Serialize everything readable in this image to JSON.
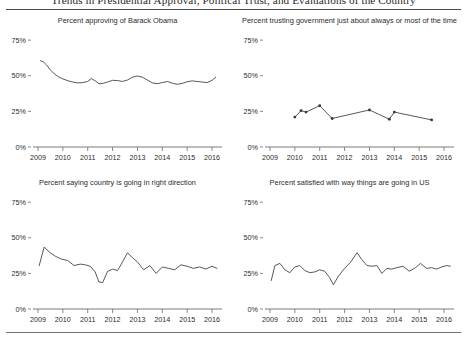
{
  "figure": {
    "title": "Trends in Presidential Approval, Political Trust, and Evaluations of the Country",
    "background": "#ffffff",
    "line_color": "#3a3a3a",
    "axis_color": "#6b6b6b",
    "text_color": "#2b2b2b"
  },
  "axis": {
    "y_ticks": [
      "0%",
      "25%",
      "50%",
      "75%"
    ],
    "y_values": [
      0,
      25,
      50,
      75
    ],
    "ylim": [
      0,
      80
    ],
    "x_ticks": [
      "2009",
      "2010",
      "2011",
      "2012",
      "2013",
      "2014",
      "2015",
      "2016"
    ],
    "x_values": [
      2009,
      2010,
      2011,
      2012,
      2013,
      2014,
      2015,
      2016
    ],
    "xlim": [
      2008.8,
      2016.4
    ],
    "grid": false,
    "legend": "none"
  },
  "chart_data": [
    {
      "type": "line",
      "panel": 0,
      "title": "Percent approving of Barack Obama",
      "xlabel": "",
      "ylabel": "",
      "ylim": [
        0,
        80
      ],
      "xlim": [
        2008.8,
        2016.4
      ],
      "markers": false,
      "x": [
        2009.1,
        2009.2,
        2009.35,
        2009.5,
        2009.65,
        2009.8,
        2010.0,
        2010.2,
        2010.4,
        2010.6,
        2010.8,
        2011.0,
        2011.15,
        2011.3,
        2011.45,
        2011.6,
        2011.8,
        2012.0,
        2012.2,
        2012.4,
        2012.6,
        2012.8,
        2013.0,
        2013.2,
        2013.4,
        2013.6,
        2013.8,
        2014.0,
        2014.2,
        2014.4,
        2014.6,
        2014.8,
        2015.0,
        2015.2,
        2015.4,
        2015.6,
        2015.8,
        2016.0,
        2016.15
      ],
      "y": [
        60.5,
        60.0,
        57.5,
        54.0,
        51.5,
        49.5,
        47.8,
        46.5,
        45.6,
        45.0,
        45.2,
        46.0,
        48.0,
        46.5,
        44.4,
        44.6,
        45.6,
        46.8,
        46.6,
        46.0,
        47.0,
        49.0,
        49.8,
        49.0,
        47.0,
        45.0,
        44.4,
        45.2,
        46.0,
        44.8,
        44.0,
        44.6,
        45.8,
        46.4,
        46.0,
        45.6,
        45.2,
        46.8,
        49.0
      ]
    },
    {
      "type": "line",
      "panel": 1,
      "title": "Percent trusting government just about always or most of the time",
      "xlabel": "",
      "ylabel": "",
      "ylim": [
        0,
        80
      ],
      "xlim": [
        2008.8,
        2016.4
      ],
      "markers": true,
      "x": [
        2010.0,
        2010.25,
        2010.45,
        2011.0,
        2011.5,
        2013.0,
        2013.8,
        2014.0,
        2015.5
      ],
      "y": [
        21.0,
        25.5,
        24.5,
        29.0,
        20.0,
        26.0,
        19.5,
        24.5,
        19.0
      ]
    },
    {
      "type": "line",
      "panel": 2,
      "title": "Percent saying country is going in right direction",
      "xlabel": "",
      "ylabel": "",
      "ylim": [
        0,
        80
      ],
      "xlim": [
        2008.8,
        2016.4
      ],
      "markers": false,
      "x": [
        2009.05,
        2009.25,
        2009.45,
        2009.7,
        2009.95,
        2010.2,
        2010.45,
        2010.7,
        2010.9,
        2011.1,
        2011.3,
        2011.45,
        2011.6,
        2011.8,
        2012.0,
        2012.2,
        2012.4,
        2012.6,
        2012.8,
        2013.0,
        2013.25,
        2013.5,
        2013.75,
        2014.0,
        2014.25,
        2014.5,
        2014.75,
        2015.0,
        2015.25,
        2015.5,
        2015.75,
        2016.0,
        2016.2
      ],
      "y": [
        30.5,
        43.5,
        40.0,
        37.0,
        35.0,
        34.0,
        30.5,
        31.5,
        31.0,
        30.0,
        26.0,
        19.0,
        18.5,
        26.5,
        28.0,
        27.0,
        33.0,
        39.5,
        36.0,
        33.0,
        27.5,
        30.5,
        25.0,
        29.5,
        28.5,
        27.5,
        31.0,
        30.0,
        28.5,
        29.5,
        28.0,
        30.0,
        28.5
      ]
    },
    {
      "type": "line",
      "panel": 3,
      "title": "Percent satisfied with way things are going in US",
      "xlabel": "",
      "ylabel": "",
      "ylim": [
        0,
        80
      ],
      "xlim": [
        2008.8,
        2016.4
      ],
      "markers": false,
      "x": [
        2009.05,
        2009.2,
        2009.4,
        2009.6,
        2009.8,
        2010.0,
        2010.2,
        2010.4,
        2010.6,
        2010.8,
        2011.0,
        2011.2,
        2011.4,
        2011.55,
        2011.75,
        2012.0,
        2012.25,
        2012.5,
        2012.7,
        2012.9,
        2013.1,
        2013.3,
        2013.5,
        2013.7,
        2013.9,
        2014.1,
        2014.35,
        2014.6,
        2014.85,
        2015.05,
        2015.3,
        2015.5,
        2015.7,
        2015.9,
        2016.1,
        2016.25
      ],
      "y": [
        20.0,
        30.5,
        32.0,
        27.5,
        25.5,
        29.5,
        30.5,
        27.0,
        25.5,
        26.0,
        27.5,
        26.5,
        22.0,
        17.0,
        23.0,
        28.5,
        33.0,
        39.5,
        34.5,
        30.5,
        30.0,
        30.5,
        25.0,
        28.5,
        28.0,
        29.0,
        30.0,
        26.5,
        29.0,
        32.0,
        28.5,
        29.0,
        28.0,
        29.5,
        30.5,
        30.0
      ]
    }
  ]
}
